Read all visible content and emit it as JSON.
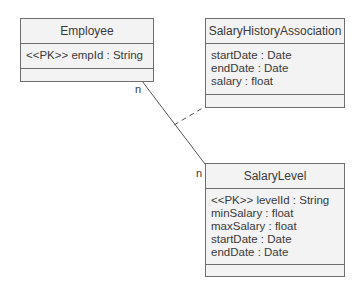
{
  "classes": {
    "employee": {
      "name": "Employee",
      "attributes": [
        "<<PK>> empId : String"
      ]
    },
    "salary_history_association": {
      "name": "SalaryHistoryAssociation",
      "attributes": [
        "startDate : Date",
        "endDate : Date",
        "salary : float"
      ]
    },
    "salary_level": {
      "name": "SalaryLevel",
      "attributes": [
        "<<PK>> levelId : String",
        "minSalary : float",
        "maxSalary : float",
        "startDate : Date",
        "endDate : Date"
      ]
    }
  },
  "associations": {
    "employee_salarylevel": {
      "from": "Employee",
      "to": "SalaryLevel",
      "from_multiplicity": "n",
      "to_multiplicity": "n",
      "association_class": "SalaryHistoryAssociation"
    }
  },
  "colors": {
    "border": "#6e6e6e",
    "fill": "#f3f3f3",
    "line": "#555555"
  }
}
